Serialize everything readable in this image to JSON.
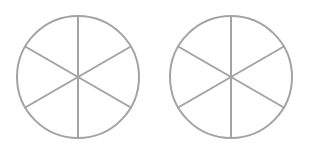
{
  "diagram": {
    "stroke_color": "#a3a3a3",
    "stroke_width": 2,
    "background": "#ffffff",
    "circles": [
      {
        "name": "left-circle",
        "cx": 78,
        "cy": 77,
        "r": 61,
        "sectors": 6,
        "spoke_angles_deg": [
          90,
          30,
          -30,
          -90,
          -150,
          150
        ],
        "shaded_sectors": []
      },
      {
        "name": "right-circle",
        "cx": 231,
        "cy": 77,
        "r": 61,
        "sectors": 6,
        "spoke_angles_deg": [
          90,
          30,
          -30,
          -90,
          -150,
          150
        ],
        "shaded_sectors": []
      }
    ]
  }
}
